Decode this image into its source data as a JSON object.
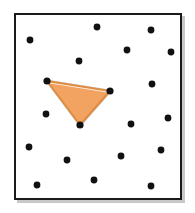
{
  "figure": {
    "width": 195,
    "height": 213,
    "background_color": "#ffffff"
  },
  "frame": {
    "label": "bounding-box",
    "x": 14,
    "y": 13,
    "width": 168,
    "height": 187,
    "stroke_color": "#1a1a1a",
    "stroke_width": 2,
    "fill_color": "#ffffff",
    "shadow_color": "#9a9a9a"
  },
  "triangle": {
    "label": "highlighted-triangle",
    "fill_color": "#f2a361",
    "stroke_color": "#e08b3e",
    "stroke_width": 2,
    "halo_color": "#d8dde2",
    "vertices": [
      {
        "name": "apex-left",
        "x": 47,
        "y": 81
      },
      {
        "name": "apex-right",
        "x": 110,
        "y": 91
      },
      {
        "name": "apex-bottom",
        "x": 80,
        "y": 125
      }
    ],
    "points_string": "47,81 110,91 80,125"
  },
  "points": {
    "label": "scattered-points",
    "count": 20,
    "color": "#111111",
    "radius": 3.4,
    "items": [
      {
        "id": "p1",
        "x": 97,
        "y": 27
      },
      {
        "id": "p2",
        "x": 151,
        "y": 30
      },
      {
        "id": "p3",
        "x": 30,
        "y": 40
      },
      {
        "id": "p4",
        "x": 127,
        "y": 50
      },
      {
        "id": "p5",
        "x": 171,
        "y": 52
      },
      {
        "id": "p6",
        "x": 79,
        "y": 61
      },
      {
        "id": "p7",
        "x": 47,
        "y": 81
      },
      {
        "id": "p8",
        "x": 152,
        "y": 84
      },
      {
        "id": "p9",
        "x": 110,
        "y": 91
      },
      {
        "id": "p10",
        "x": 46,
        "y": 114
      },
      {
        "id": "p11",
        "x": 168,
        "y": 118
      },
      {
        "id": "p12",
        "x": 131,
        "y": 124
      },
      {
        "id": "p13",
        "x": 80,
        "y": 125
      },
      {
        "id": "p14",
        "x": 29,
        "y": 147
      },
      {
        "id": "p15",
        "x": 161,
        "y": 150
      },
      {
        "id": "p16",
        "x": 121,
        "y": 156
      },
      {
        "id": "p17",
        "x": 67,
        "y": 160
      },
      {
        "id": "p18",
        "x": 94,
        "y": 180
      },
      {
        "id": "p19",
        "x": 37,
        "y": 185
      },
      {
        "id": "p20",
        "x": 151,
        "y": 186
      }
    ]
  }
}
